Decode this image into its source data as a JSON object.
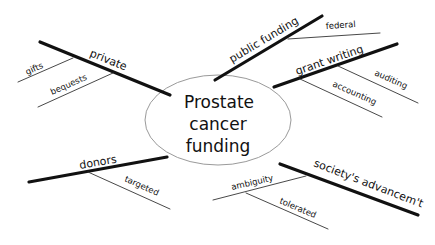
{
  "diagram": {
    "type": "mind-map",
    "center": {
      "lines": [
        "Prostate",
        "cancer",
        "funding"
      ]
    },
    "branches": [
      {
        "label": "private",
        "children": [
          {
            "label": "gifts"
          },
          {
            "label": "bequests"
          }
        ]
      },
      {
        "label": "public funding",
        "children": [
          {
            "label": "federal"
          }
        ]
      },
      {
        "label": "grant writing",
        "children": [
          {
            "label": "auditing"
          },
          {
            "label": "accounting"
          }
        ]
      },
      {
        "label": "donors",
        "children": [
          {
            "label": "targeted"
          }
        ]
      },
      {
        "label": "society's advancem't",
        "children": [
          {
            "label": "ambiguity"
          },
          {
            "label": "tolerated"
          }
        ]
      }
    ]
  }
}
